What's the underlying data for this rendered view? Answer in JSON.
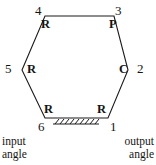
{
  "figure": {
    "type": "kinematic-chain-diagram",
    "stroke_color": "#1a1a1a",
    "background_color": "#ffffff"
  },
  "vertices": [
    {
      "id": "1",
      "number": "1",
      "joint_type": "R",
      "x": 108,
      "y": 118
    },
    {
      "id": "2",
      "number": "2",
      "joint_type": "C",
      "x": 128,
      "y": 70
    },
    {
      "id": "3",
      "number": "3",
      "joint_type": "P",
      "x": 114,
      "y": 16
    },
    {
      "id": "4",
      "number": "4",
      "joint_type": "R",
      "x": 45,
      "y": 16
    },
    {
      "id": "5",
      "number": "5",
      "joint_type": "R",
      "x": 22,
      "y": 70
    },
    {
      "id": "6",
      "number": "6",
      "joint_type": "R",
      "x": 45,
      "y": 118
    }
  ],
  "ground": {
    "name": "ground-hatching",
    "edge_from": "6",
    "edge_to": "1",
    "hatch_count": 9
  },
  "captions": {
    "input_line1": "input",
    "input_line2": "angle",
    "output_line1": "output",
    "output_line2": "angle"
  }
}
